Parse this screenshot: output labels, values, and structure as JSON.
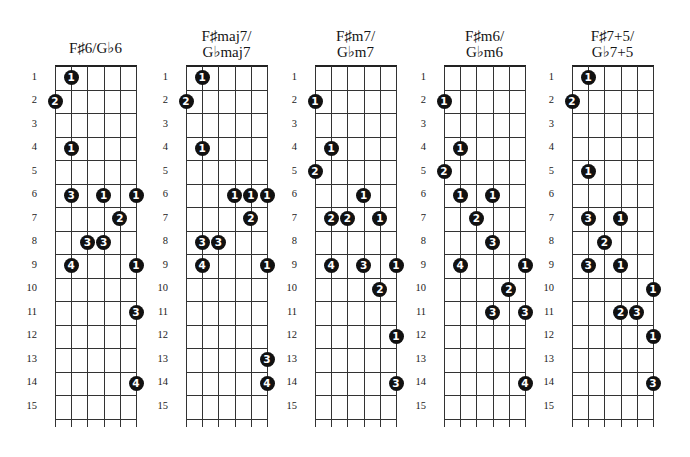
{
  "layout": {
    "grid_top": 66,
    "fret_spacing": 23.5,
    "string_spacing": 16.2,
    "num_frets": 15,
    "num_strings": 6
  },
  "diagrams": [
    {
      "title_lines": [
        "F♯6/G♭6"
      ],
      "title_top": 40,
      "left": 55,
      "fret_labels": [
        "1",
        "2",
        "3",
        "4",
        "5",
        "6",
        "7",
        "8",
        "9",
        "10",
        "11",
        "12",
        "13",
        "14",
        "15"
      ],
      "dots": [
        {
          "fret": 1,
          "string": 2,
          "finger": "1"
        },
        {
          "fret": 2,
          "string": 1,
          "finger": "2"
        },
        {
          "fret": 4,
          "string": 2,
          "finger": "1"
        },
        {
          "fret": 6,
          "string": 2,
          "finger": "3"
        },
        {
          "fret": 6,
          "string": 4,
          "finger": "1"
        },
        {
          "fret": 6,
          "string": 6,
          "finger": "1"
        },
        {
          "fret": 7,
          "string": 5,
          "finger": "2"
        },
        {
          "fret": 8,
          "string": 3,
          "finger": "3"
        },
        {
          "fret": 8,
          "string": 4,
          "finger": "3"
        },
        {
          "fret": 9,
          "string": 2,
          "finger": "4"
        },
        {
          "fret": 9,
          "string": 6,
          "finger": "1"
        },
        {
          "fret": 11,
          "string": 6,
          "finger": "3"
        },
        {
          "fret": 14,
          "string": 6,
          "finger": "4"
        }
      ]
    },
    {
      "title_lines": [
        "F♯maj7/",
        "G♭maj7"
      ],
      "title_top": 28,
      "left": 186,
      "fret_labels": [
        "1",
        "2",
        "3",
        "4",
        "5",
        "6",
        "7",
        "8",
        "9",
        "10",
        "11",
        "12",
        "13",
        "14",
        "15"
      ],
      "dots": [
        {
          "fret": 1,
          "string": 2,
          "finger": "1"
        },
        {
          "fret": 2,
          "string": 1,
          "finger": "2"
        },
        {
          "fret": 4,
          "string": 2,
          "finger": "1"
        },
        {
          "fret": 6,
          "string": 4,
          "finger": "1"
        },
        {
          "fret": 6,
          "string": 5,
          "finger": "1"
        },
        {
          "fret": 6,
          "string": 6,
          "finger": "1"
        },
        {
          "fret": 7,
          "string": 5,
          "finger": "2"
        },
        {
          "fret": 8,
          "string": 2,
          "finger": "3"
        },
        {
          "fret": 8,
          "string": 3,
          "finger": "3"
        },
        {
          "fret": 9,
          "string": 2,
          "finger": "4"
        },
        {
          "fret": 9,
          "string": 6,
          "finger": "1"
        },
        {
          "fret": 13,
          "string": 6,
          "finger": "3"
        },
        {
          "fret": 14,
          "string": 6,
          "finger": "4"
        }
      ]
    },
    {
      "title_lines": [
        "F♯m7/",
        "G♭m7"
      ],
      "title_top": 28,
      "left": 315,
      "fret_labels": [
        "1",
        "2",
        "3",
        "4",
        "5",
        "6",
        "7",
        "8",
        "9",
        "10",
        "11",
        "12",
        "13",
        "14",
        "15"
      ],
      "dots": [
        {
          "fret": 2,
          "string": 1,
          "finger": "1"
        },
        {
          "fret": 4,
          "string": 2,
          "finger": "1"
        },
        {
          "fret": 5,
          "string": 1,
          "finger": "2"
        },
        {
          "fret": 6,
          "string": 4,
          "finger": "1"
        },
        {
          "fret": 7,
          "string": 2,
          "finger": "2"
        },
        {
          "fret": 7,
          "string": 3,
          "finger": "2"
        },
        {
          "fret": 7,
          "string": 5,
          "finger": "1"
        },
        {
          "fret": 9,
          "string": 2,
          "finger": "4"
        },
        {
          "fret": 9,
          "string": 4,
          "finger": "3"
        },
        {
          "fret": 9,
          "string": 6,
          "finger": "1"
        },
        {
          "fret": 10,
          "string": 5,
          "finger": "2"
        },
        {
          "fret": 12,
          "string": 6,
          "finger": "1"
        },
        {
          "fret": 14,
          "string": 6,
          "finger": "3"
        }
      ]
    },
    {
      "title_lines": [
        "F♯m6/",
        "G♭m6"
      ],
      "title_top": 28,
      "left": 444,
      "fret_labels": [
        "1",
        "2",
        "3",
        "4",
        "5",
        "6",
        "7",
        "8",
        "9",
        "10",
        "11",
        "12",
        "13",
        "14",
        "15"
      ],
      "dots": [
        {
          "fret": 2,
          "string": 1,
          "finger": "1"
        },
        {
          "fret": 4,
          "string": 2,
          "finger": "1"
        },
        {
          "fret": 5,
          "string": 1,
          "finger": "2"
        },
        {
          "fret": 6,
          "string": 2,
          "finger": "1"
        },
        {
          "fret": 6,
          "string": 4,
          "finger": "1"
        },
        {
          "fret": 7,
          "string": 3,
          "finger": "2"
        },
        {
          "fret": 8,
          "string": 4,
          "finger": "3"
        },
        {
          "fret": 9,
          "string": 2,
          "finger": "4"
        },
        {
          "fret": 9,
          "string": 6,
          "finger": "1"
        },
        {
          "fret": 10,
          "string": 5,
          "finger": "2"
        },
        {
          "fret": 11,
          "string": 4,
          "finger": "3"
        },
        {
          "fret": 11,
          "string": 6,
          "finger": "3"
        },
        {
          "fret": 14,
          "string": 6,
          "finger": "4"
        }
      ]
    },
    {
      "title_lines": [
        "F♯7+5/",
        "G♭7+5"
      ],
      "title_top": 28,
      "left": 572,
      "fret_labels": [
        "1",
        "2",
        "3",
        "4",
        "5",
        "6",
        "7",
        "8",
        "9",
        "10",
        "11",
        "12",
        "13",
        "14",
        "15"
      ],
      "dots": [
        {
          "fret": 1,
          "string": 2,
          "finger": "1"
        },
        {
          "fret": 2,
          "string": 1,
          "finger": "2"
        },
        {
          "fret": 5,
          "string": 2,
          "finger": "1"
        },
        {
          "fret": 7,
          "string": 2,
          "finger": "3"
        },
        {
          "fret": 7,
          "string": 4,
          "finger": "1"
        },
        {
          "fret": 8,
          "string": 3,
          "finger": "2"
        },
        {
          "fret": 9,
          "string": 2,
          "finger": "3"
        },
        {
          "fret": 9,
          "string": 4,
          "finger": "1"
        },
        {
          "fret": 10,
          "string": 6,
          "finger": "1"
        },
        {
          "fret": 11,
          "string": 4,
          "finger": "2"
        },
        {
          "fret": 11,
          "string": 5,
          "finger": "3"
        },
        {
          "fret": 12,
          "string": 6,
          "finger": "1"
        },
        {
          "fret": 14,
          "string": 6,
          "finger": "3"
        }
      ]
    }
  ]
}
